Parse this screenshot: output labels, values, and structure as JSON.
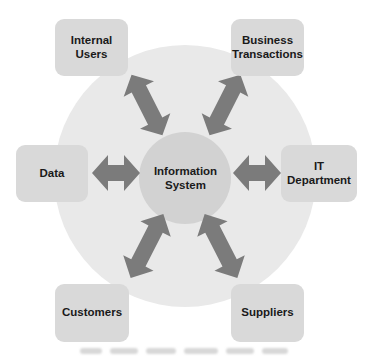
{
  "diagram": {
    "title": "Information System",
    "center": {
      "label_line1": "Information",
      "label_line2": "System"
    },
    "nodes": [
      {
        "id": "internal-users",
        "label_line1": "Internal Users",
        "label_line2": ""
      },
      {
        "id": "business-transactions",
        "label_line1": "Business",
        "label_line2": "Transactions"
      },
      {
        "id": "data",
        "label_line1": "Data",
        "label_line2": ""
      },
      {
        "id": "it-department",
        "label_line1": "IT Department",
        "label_line2": ""
      },
      {
        "id": "customers",
        "label_line1": "Customers",
        "label_line2": ""
      },
      {
        "id": "suppliers",
        "label_line1": "Suppliers",
        "label_line2": ""
      }
    ],
    "edges": [
      {
        "from": "Information System",
        "to": "Internal Users",
        "type": "bidirectional"
      },
      {
        "from": "Information System",
        "to": "Business Transactions",
        "type": "bidirectional"
      },
      {
        "from": "Information System",
        "to": "Data",
        "type": "bidirectional"
      },
      {
        "from": "Information System",
        "to": "IT Department",
        "type": "bidirectional"
      },
      {
        "from": "Information System",
        "to": "Customers",
        "type": "bidirectional"
      },
      {
        "from": "Information System",
        "to": "Suppliers",
        "type": "bidirectional"
      }
    ],
    "colors": {
      "background": "#ffffff",
      "outer_circle": "#e9e9e9",
      "inner_circle": "#d2d2d2",
      "box": "#d9d9d9",
      "arrow": "#7b7b7b",
      "text": "#1a1a1a"
    }
  }
}
